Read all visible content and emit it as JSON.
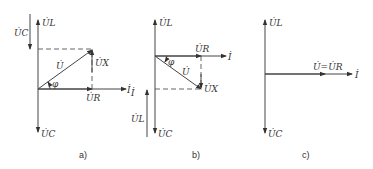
{
  "figure": {
    "panels": [
      {
        "id": "a",
        "caption": "a)",
        "labels": {
          "UL": "U̇L",
          "UC_top": "U̇C",
          "UC": "U̇C",
          "U": "U̇",
          "UX": "U̇X",
          "UR": "U̇R",
          "I": "İ",
          "phi": "φ"
        }
      },
      {
        "id": "b",
        "caption": "b)",
        "labels": {
          "UL": "U̇L",
          "UL_side": "U̇L",
          "UC": "U̇C",
          "U": "U̇",
          "UX": "U̇X",
          "UR": "U̇R",
          "I": "İ",
          "I_side": "İ",
          "phi": "φ"
        }
      },
      {
        "id": "c",
        "caption": "c)",
        "labels": {
          "UL": "U̇L",
          "UC": "U̇C",
          "U_eq_UR": "U̇=U̇R",
          "I": "İ"
        }
      }
    ]
  }
}
